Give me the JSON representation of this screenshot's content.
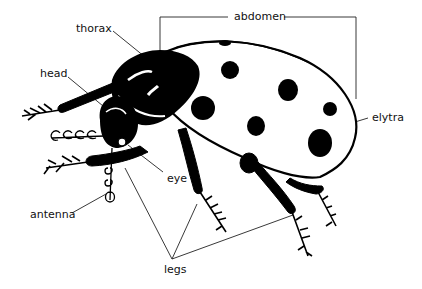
{
  "diagram": {
    "title": "",
    "labels": {
      "thorax": "thorax",
      "abdomen": "abdomen",
      "head": "head",
      "elytra": "elytra",
      "eye": "eye",
      "antenna": "antenna",
      "legs": "legs"
    },
    "colors": {
      "ink": "#000000",
      "background": "#ffffff",
      "leader_line": "#222222"
    }
  }
}
